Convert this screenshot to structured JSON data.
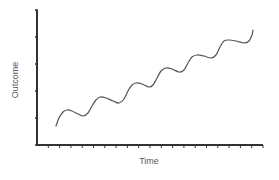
{
  "chart_data": {
    "type": "line",
    "title": "",
    "xlabel": "Time",
    "ylabel": "Outcome",
    "grid": false,
    "legend": null,
    "x_ticks": 20,
    "y_ticks": 5,
    "tick_labels": {
      "x": [],
      "y": []
    },
    "series": [
      {
        "name": "Outcome over time",
        "description": "Upward trend with periodic wave oscillations",
        "points_px": [
          [
            56,
            126
          ],
          [
            59,
            118
          ],
          [
            63,
            112
          ],
          [
            67,
            110
          ],
          [
            72,
            111
          ],
          [
            78,
            114
          ],
          [
            83,
            116
          ],
          [
            88,
            113
          ],
          [
            92,
            106
          ],
          [
            96,
            100
          ],
          [
            100,
            97
          ],
          [
            106,
            98
          ],
          [
            113,
            101
          ],
          [
            119,
            103
          ],
          [
            124,
            99
          ],
          [
            128,
            91
          ],
          [
            132,
            85
          ],
          [
            136,
            83
          ],
          [
            142,
            84
          ],
          [
            149,
            87
          ],
          [
            153,
            85
          ],
          [
            157,
            78
          ],
          [
            161,
            71
          ],
          [
            166,
            68
          ],
          [
            172,
            69
          ],
          [
            179,
            72
          ],
          [
            184,
            70
          ],
          [
            188,
            63
          ],
          [
            192,
            57
          ],
          [
            197,
            55
          ],
          [
            204,
            56
          ],
          [
            211,
            58
          ],
          [
            216,
            55
          ],
          [
            220,
            47
          ],
          [
            224,
            41
          ],
          [
            229,
            40
          ],
          [
            236,
            41
          ],
          [
            244,
            43
          ],
          [
            249,
            41
          ],
          [
            252,
            35
          ],
          [
            253,
            30
          ]
        ],
        "color": "#555555"
      }
    ],
    "axis_px": {
      "origin": [
        37,
        145
      ],
      "x_end": 263,
      "y_top": 10
    }
  },
  "axes": {
    "xlabel": "Time",
    "ylabel": "Outcome"
  },
  "colors": {
    "axis": "#333333",
    "line": "#555555",
    "label": "#555555"
  }
}
